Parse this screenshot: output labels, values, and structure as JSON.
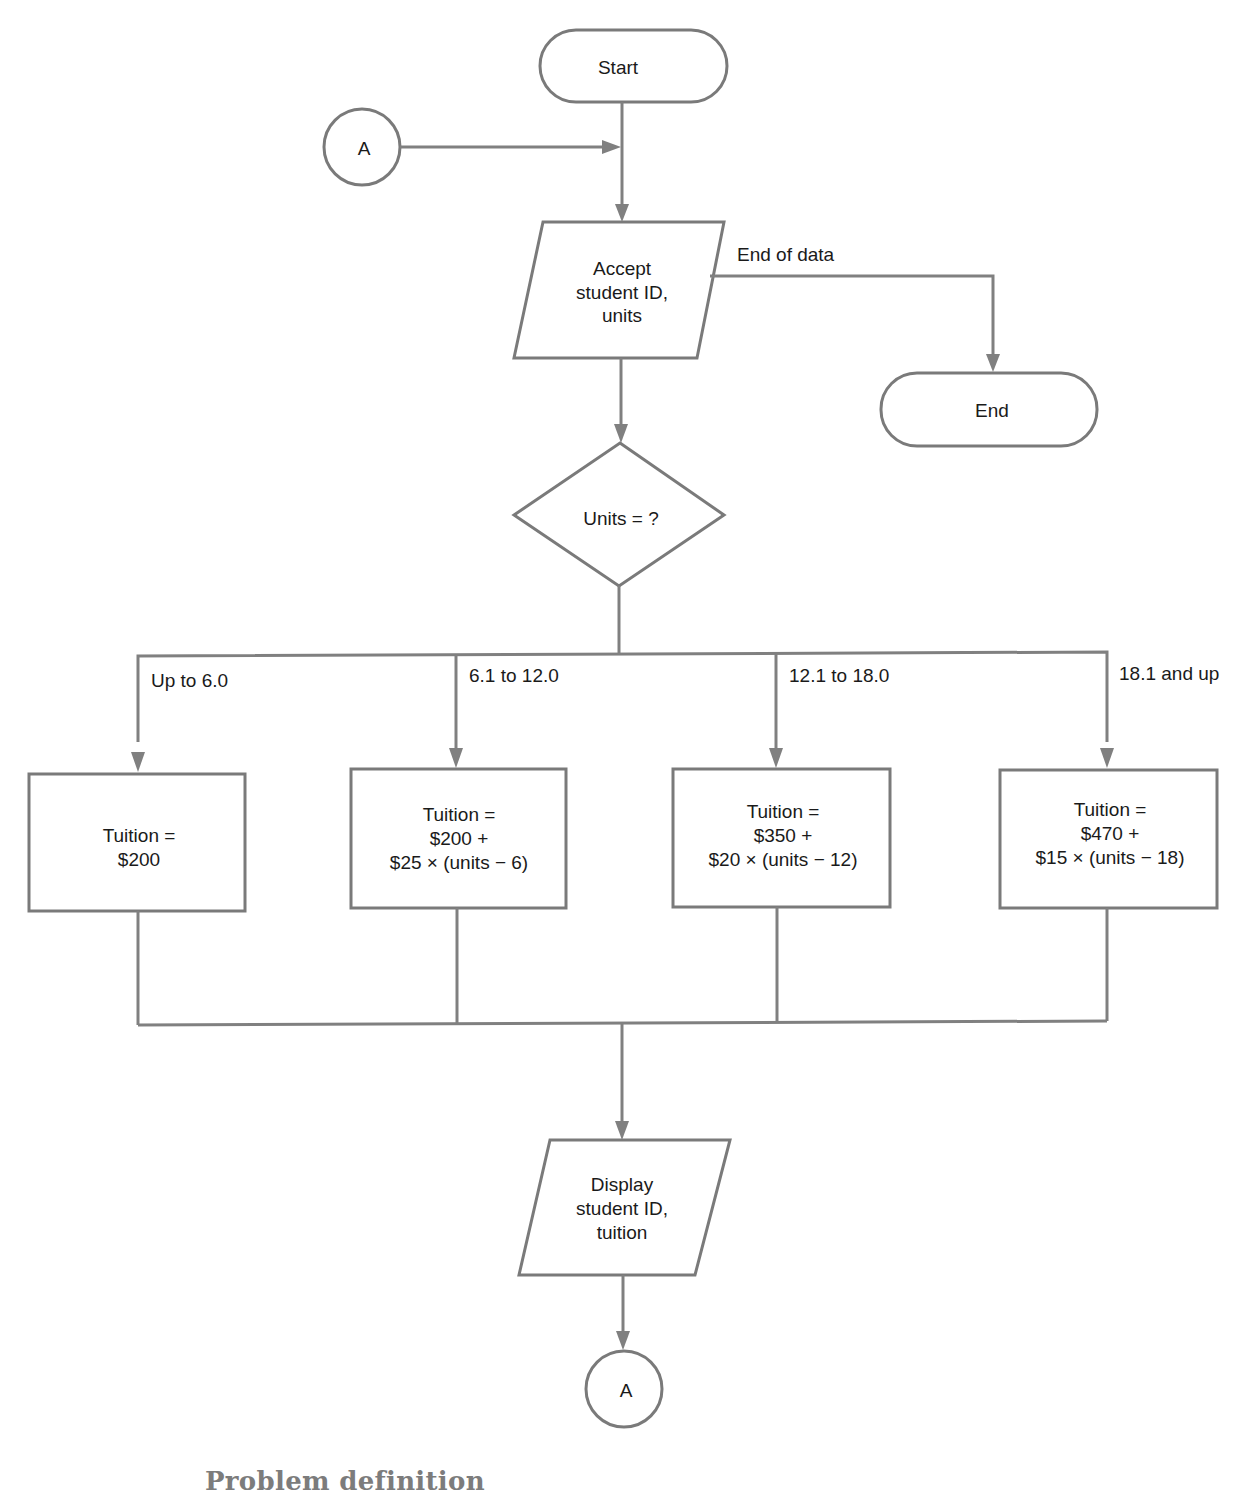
{
  "flowchart": {
    "start": {
      "label": "Start"
    },
    "end": {
      "label": "End"
    },
    "connector_in": {
      "label": "A"
    },
    "connector_out": {
      "label": "A"
    },
    "input": {
      "lines": [
        "Accept",
        "student ID,",
        "units"
      ]
    },
    "end_of_data_label": "End of data",
    "decision": {
      "label": "Units  =  ?"
    },
    "branches": [
      {
        "condition": "Up to 6.0",
        "lines": [
          "Tuition  =",
          "$200"
        ]
      },
      {
        "condition": "6.1  to  12.0",
        "lines": [
          "Tuition  =",
          "$200  +",
          "$25  ×  (units  −  6)"
        ]
      },
      {
        "condition": "12.1  to  18.0",
        "lines": [
          "Tuition  =",
          "$350  +",
          "$20  ×  (units  −  12)"
        ]
      },
      {
        "condition": "18.1  and up",
        "lines": [
          "Tuition  =",
          "$470  +",
          "$15  ×  (units  −  18)"
        ]
      }
    ],
    "output": {
      "lines": [
        "Display",
        "student ID,",
        "tuition"
      ]
    }
  },
  "section_heading": "Problem definition",
  "colors": {
    "stroke": "#7a7a7a",
    "text": "#1a1a1a",
    "heading": "#7c7c7c"
  }
}
